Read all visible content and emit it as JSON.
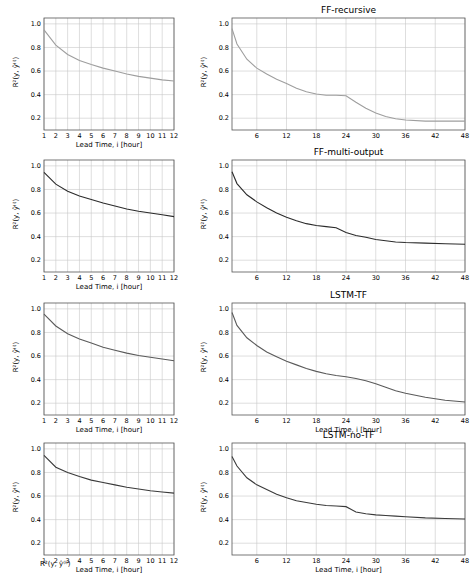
{
  "chart_data": [
    {
      "id": "ff-recursive-left",
      "type": "line",
      "title": "",
      "xlabel": "Lead Time, i [hour]",
      "ylabel": "R²(y, ŷ⁽ⁱ⁾)",
      "xlim": [
        1,
        12
      ],
      "ylim": [
        0.1,
        1.05
      ],
      "xticks": [
        1,
        2,
        3,
        4,
        5,
        6,
        7,
        8,
        9,
        10,
        11,
        12
      ],
      "yticks": [
        0.2,
        0.4,
        0.6,
        0.8,
        1.0
      ],
      "grid": true,
      "color": "#9e9e9e",
      "x": [
        1,
        2,
        3,
        4,
        5,
        6,
        7,
        8,
        9,
        10,
        11,
        12
      ],
      "values": [
        0.95,
        0.82,
        0.74,
        0.69,
        0.655,
        0.625,
        0.6,
        0.575,
        0.555,
        0.54,
        0.525,
        0.515
      ]
    },
    {
      "id": "ff-recursive-right",
      "type": "line",
      "title": "FF-recursive",
      "xlabel": "",
      "ylabel": "R²(y, ŷ⁽ⁱ⁾)",
      "xlim": [
        1,
        48
      ],
      "ylim": [
        0.1,
        1.05
      ],
      "xticks": [
        6,
        12,
        18,
        24,
        30,
        36,
        42,
        48
      ],
      "yticks": [
        0.2,
        0.4,
        0.6,
        0.8,
        1.0
      ],
      "grid": true,
      "color": "#9e9e9e",
      "x": [
        1,
        2,
        4,
        6,
        8,
        10,
        12,
        14,
        16,
        18,
        20,
        22,
        24,
        26,
        28,
        30,
        32,
        34,
        36,
        40,
        44,
        48
      ],
      "values": [
        0.96,
        0.83,
        0.7,
        0.625,
        0.575,
        0.53,
        0.495,
        0.455,
        0.425,
        0.405,
        0.395,
        0.395,
        0.39,
        0.335,
        0.285,
        0.245,
        0.215,
        0.195,
        0.185,
        0.175,
        0.175,
        0.175
      ]
    },
    {
      "id": "ff-multi-output-left",
      "type": "line",
      "title": "",
      "xlabel": "Lead Time, i [hour]",
      "ylabel": "R²(y, ŷ⁽ⁱ⁾)",
      "xlim": [
        1,
        12
      ],
      "ylim": [
        0.1,
        1.05
      ],
      "xticks": [
        1,
        2,
        3,
        4,
        5,
        6,
        7,
        8,
        9,
        10,
        11,
        12
      ],
      "yticks": [
        0.2,
        0.4,
        0.6,
        0.8,
        1.0
      ],
      "grid": true,
      "color": "#2b2b2b",
      "x": [
        1,
        2,
        3,
        4,
        5,
        6,
        7,
        8,
        9,
        10,
        11,
        12
      ],
      "values": [
        0.945,
        0.845,
        0.785,
        0.745,
        0.715,
        0.685,
        0.66,
        0.635,
        0.615,
        0.6,
        0.585,
        0.57
      ]
    },
    {
      "id": "ff-multi-output-right",
      "type": "line",
      "title": "FF-multi-output",
      "xlabel": "",
      "ylabel": "R²(y, ŷ⁽ⁱ⁾)",
      "xlim": [
        1,
        48
      ],
      "ylim": [
        0.1,
        1.05
      ],
      "xticks": [
        6,
        12,
        18,
        24,
        30,
        36,
        42,
        48
      ],
      "yticks": [
        0.2,
        0.4,
        0.6,
        0.8,
        1.0
      ],
      "grid": true,
      "color": "#2b2b2b",
      "x": [
        1,
        2,
        4,
        6,
        8,
        10,
        12,
        14,
        16,
        18,
        20,
        22,
        24,
        26,
        28,
        30,
        32,
        34,
        36,
        40,
        44,
        48
      ],
      "values": [
        0.95,
        0.85,
        0.755,
        0.695,
        0.645,
        0.6,
        0.565,
        0.535,
        0.51,
        0.495,
        0.485,
        0.475,
        0.435,
        0.41,
        0.395,
        0.375,
        0.365,
        0.355,
        0.35,
        0.345,
        0.34,
        0.335
      ]
    },
    {
      "id": "lstm-tf-left",
      "type": "line",
      "title": "",
      "xlabel": "Lead Time, i [hour]",
      "ylabel": "R²(y, ŷ⁽ⁱ⁾)",
      "xlim": [
        1,
        12
      ],
      "ylim": [
        0.1,
        1.05
      ],
      "xticks": [
        1,
        2,
        3,
        4,
        5,
        6,
        7,
        8,
        9,
        10,
        11,
        12
      ],
      "yticks": [
        0.2,
        0.4,
        0.6,
        0.8,
        1.0
      ],
      "grid": true,
      "color": "#5a5a5a",
      "x": [
        1,
        2,
        3,
        4,
        5,
        6,
        7,
        8,
        9,
        10,
        11,
        12
      ],
      "values": [
        0.955,
        0.855,
        0.79,
        0.745,
        0.71,
        0.675,
        0.65,
        0.625,
        0.605,
        0.59,
        0.575,
        0.56
      ]
    },
    {
      "id": "lstm-tf-right",
      "type": "line",
      "title": "LSTM-TF",
      "xlabel": "Lead Time, i [hour]",
      "ylabel": "R²(y, ŷ⁽ⁱ⁾)",
      "xlim": [
        1,
        48
      ],
      "ylim": [
        0.1,
        1.05
      ],
      "xticks": [
        6,
        12,
        18,
        24,
        30,
        36,
        42,
        48
      ],
      "yticks": [
        0.2,
        0.4,
        0.6,
        0.8,
        1.0
      ],
      "grid": true,
      "color": "#5a5a5a",
      "x": [
        1,
        2,
        4,
        6,
        8,
        10,
        12,
        14,
        16,
        18,
        20,
        22,
        24,
        26,
        28,
        30,
        32,
        34,
        36,
        40,
        44,
        48
      ],
      "values": [
        0.97,
        0.86,
        0.755,
        0.69,
        0.635,
        0.595,
        0.555,
        0.525,
        0.495,
        0.47,
        0.45,
        0.435,
        0.425,
        0.41,
        0.39,
        0.365,
        0.335,
        0.305,
        0.285,
        0.25,
        0.225,
        0.21
      ]
    },
    {
      "id": "lstm-no-tf-left",
      "type": "line",
      "title": "",
      "xlabel": "Lead Time, i [hour]",
      "ylabel": "R²(y, ŷ⁽ⁱ⁾)",
      "xlim": [
        1,
        12
      ],
      "ylim": [
        0.1,
        1.05
      ],
      "xticks": [
        1,
        2,
        3,
        4,
        5,
        6,
        7,
        8,
        9,
        10,
        11,
        12
      ],
      "yticks": [
        0.2,
        0.4,
        0.6,
        0.8,
        1.0
      ],
      "grid": true,
      "color": "#3a3a3a",
      "x": [
        1,
        2,
        3,
        4,
        5,
        6,
        7,
        8,
        9,
        10,
        11,
        12
      ],
      "values": [
        0.945,
        0.845,
        0.8,
        0.765,
        0.735,
        0.715,
        0.695,
        0.675,
        0.66,
        0.645,
        0.635,
        0.625
      ]
    },
    {
      "id": "lstm-no-tf-right",
      "type": "line",
      "title": "LSTM-no-TF",
      "xlabel": "Lead Time, i [hour]",
      "ylabel": "R²(y, ŷ⁽ⁱ⁾)",
      "xlim": [
        1,
        48
      ],
      "ylim": [
        0.1,
        1.05
      ],
      "xticks": [
        6,
        12,
        18,
        24,
        30,
        36,
        42,
        48
      ],
      "yticks": [
        0.2,
        0.4,
        0.6,
        0.8,
        1.0
      ],
      "grid": true,
      "color": "#3a3a3a",
      "x": [
        1,
        2,
        4,
        6,
        8,
        10,
        12,
        14,
        16,
        18,
        20,
        22,
        24,
        26,
        28,
        30,
        32,
        34,
        36,
        40,
        44,
        48
      ],
      "values": [
        0.935,
        0.855,
        0.755,
        0.695,
        0.655,
        0.615,
        0.585,
        0.56,
        0.545,
        0.53,
        0.52,
        0.515,
        0.51,
        0.465,
        0.45,
        0.44,
        0.435,
        0.43,
        0.425,
        0.415,
        0.41,
        0.405
      ]
    }
  ],
  "panels": [
    {
      "title": "FF-recursive"
    },
    {
      "title": "FF-multi-output"
    },
    {
      "title": "LSTM-TF"
    },
    {
      "title": "LSTM-no-TF"
    }
  ],
  "labels": {
    "ylabel": "R²(y, ŷ⁽ⁱ⁾)",
    "xlabel": "Lead Time, i [hour]",
    "yticks": [
      "1.0",
      "0.8",
      "0.6",
      "0.4",
      "0.2"
    ],
    "xticks_left": [
      "1",
      "2",
      "3",
      "4",
      "5",
      "6",
      "7",
      "8",
      "9",
      "10",
      "11",
      "12"
    ],
    "xticks_right": [
      "6",
      "12",
      "18",
      "24",
      "30",
      "36",
      "42",
      "48"
    ]
  },
  "footer": {
    "fragment": "R²(y, ŷ⁽ⁱ⁾)"
  }
}
